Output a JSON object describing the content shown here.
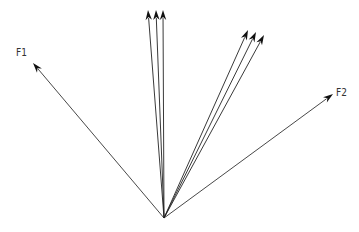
{
  "diagram": {
    "title": "",
    "origin": [
      164,
      218
    ],
    "vectors": [
      {
        "name": "F1",
        "label": "F1",
        "tip": [
          33,
          63
        ],
        "color": "#333333",
        "width": 0.9
      },
      {
        "name": "F2",
        "label": "F2",
        "tip": [
          333,
          94
        ],
        "color": "#333333",
        "width": 0.9
      },
      {
        "name": "v1",
        "label": "",
        "tip": [
          148,
          10
        ],
        "color": "#222222",
        "width": 0.9
      },
      {
        "name": "v2",
        "label": "",
        "tip": [
          156,
          10
        ],
        "color": "#222222",
        "width": 0.9
      },
      {
        "name": "v3",
        "label": "",
        "tip": [
          163,
          10
        ],
        "color": "#222222",
        "width": 0.9
      },
      {
        "name": "v4",
        "label": "",
        "tip": [
          248,
          30
        ],
        "color": "#222222",
        "width": 0.9
      },
      {
        "name": "v5",
        "label": "",
        "tip": [
          256,
          32
        ],
        "color": "#222222",
        "width": 0.9
      },
      {
        "name": "v6",
        "label": "",
        "tip": [
          264,
          35
        ],
        "color": "#222222",
        "width": 0.9
      }
    ],
    "labels": {
      "f1": {
        "text": "F1",
        "x": 16,
        "y": 46
      },
      "f2": {
        "text": "F2",
        "x": 336,
        "y": 86
      }
    }
  }
}
